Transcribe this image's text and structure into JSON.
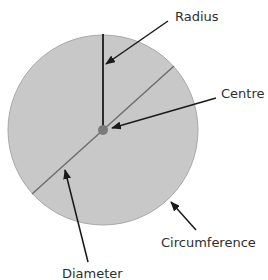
{
  "diagram": {
    "circle": {
      "cx": 103,
      "cy": 130,
      "r": 95,
      "fill": "#c8c8c8",
      "stroke": "#a8a8a8"
    },
    "centre_point": {
      "cx": 103,
      "cy": 130,
      "r": 5,
      "fill": "#7a7a7a"
    },
    "radius_line": {
      "x1": 103,
      "y1": 34,
      "x2": 103,
      "y2": 130,
      "color": "#1a1a1a"
    },
    "diameter_line": {
      "x1": 32,
      "y1": 194,
      "x2": 174,
      "y2": 66,
      "color": "#6e6e6e"
    },
    "labels": {
      "radius": "Radius",
      "centre": "Centre",
      "circumference": "Circumference",
      "diameter": "Diameter"
    },
    "arrows": [
      {
        "name": "radius",
        "x1": 168,
        "y1": 21,
        "x2": 106,
        "y2": 64
      },
      {
        "name": "centre",
        "x1": 216,
        "y1": 98,
        "x2": 112,
        "y2": 128
      },
      {
        "name": "circumference",
        "x1": 196,
        "y1": 230,
        "x2": 171,
        "y2": 202
      },
      {
        "name": "diameter",
        "x1": 88,
        "y1": 262,
        "x2": 65,
        "y2": 170
      }
    ],
    "arrow_color": "#1a1a1a"
  }
}
